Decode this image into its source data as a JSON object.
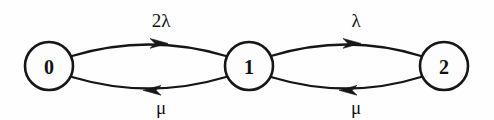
{
  "diagram": {
    "kind": "state-transition-diagram",
    "background_color": "#fefefe",
    "ink_color": "#161616",
    "nodes": [
      {
        "id": "state-0",
        "label": "0",
        "cx": 49,
        "cy": 66,
        "r": 24
      },
      {
        "id": "state-1",
        "label": "1",
        "cx": 249,
        "cy": 66,
        "r": 24
      },
      {
        "id": "state-2",
        "label": "2",
        "cx": 444,
        "cy": 66,
        "r": 24
      }
    ],
    "edges": [
      {
        "id": "edge-0-to-1",
        "from": "0",
        "to": "1",
        "direction": "right",
        "position": "top",
        "label": "2λ",
        "label_x": 161,
        "label_y": 20,
        "path": "M 72 56 Q 149 33 226 56",
        "arrow_x": 160,
        "arrow_y": 43,
        "arrow_dir": "right"
      },
      {
        "id": "edge-1-to-0",
        "from": "1",
        "to": "0",
        "direction": "left",
        "position": "bottom",
        "label": "μ",
        "label_x": 161,
        "label_y": 107,
        "path": "M 226 77 Q 149 100 72 77",
        "arrow_x": 152,
        "arrow_y": 90,
        "arrow_dir": "left"
      },
      {
        "id": "edge-1-to-2",
        "from": "1",
        "to": "2",
        "direction": "right",
        "position": "top",
        "label": "λ",
        "label_x": 356,
        "label_y": 20,
        "path": "M 271 56 Q 347 33 421 56",
        "arrow_x": 353,
        "arrow_y": 43,
        "arrow_dir": "right"
      },
      {
        "id": "edge-2-to-1",
        "from": "2",
        "to": "1",
        "direction": "left",
        "position": "bottom",
        "label": "μ",
        "label_x": 356,
        "label_y": 107,
        "path": "M 421 77 Q 347 100 271 77",
        "arrow_x": 348,
        "arrow_y": 90,
        "arrow_dir": "left"
      }
    ]
  }
}
